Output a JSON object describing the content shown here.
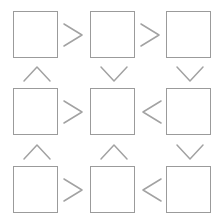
{
  "diagram": {
    "type": "grid-flow-diagram",
    "background_color": "#ffffff",
    "stroke_color": "#9b9b9b",
    "rows": 3,
    "columns": 3,
    "node_label": "empty-square-node",
    "nodes": [
      {
        "id": "node-r1c1",
        "row": 1,
        "col": 1,
        "label": "",
        "shape": "square",
        "x": 13,
        "y": 11,
        "width": 45,
        "height": 47
      },
      {
        "id": "node-r1c2",
        "row": 1,
        "col": 2,
        "label": "",
        "shape": "square",
        "x": 90,
        "y": 11,
        "width": 45,
        "height": 47
      },
      {
        "id": "node-r1c3",
        "row": 1,
        "col": 3,
        "label": "",
        "shape": "square",
        "x": 166,
        "y": 11,
        "width": 45,
        "height": 47
      },
      {
        "id": "node-r2c1",
        "row": 2,
        "col": 1,
        "label": "",
        "shape": "square",
        "x": 13,
        "y": 88,
        "width": 45,
        "height": 47
      },
      {
        "id": "node-r2c2",
        "row": 2,
        "col": 2,
        "label": "",
        "shape": "square",
        "x": 90,
        "y": 88,
        "width": 45,
        "height": 47
      },
      {
        "id": "node-r2c3",
        "row": 2,
        "col": 3,
        "label": "",
        "shape": "square",
        "x": 166,
        "y": 88,
        "width": 45,
        "height": 47
      },
      {
        "id": "node-r3c1",
        "row": 3,
        "col": 1,
        "label": "",
        "shape": "square",
        "x": 13,
        "y": 166,
        "width": 45,
        "height": 47
      },
      {
        "id": "node-r3c2",
        "row": 3,
        "col": 2,
        "label": "",
        "shape": "square",
        "x": 90,
        "y": 166,
        "width": 45,
        "height": 47
      },
      {
        "id": "node-r3c3",
        "row": 3,
        "col": 3,
        "label": "",
        "shape": "square",
        "x": 166,
        "y": 166,
        "width": 45,
        "height": 47
      }
    ],
    "connectors": [
      {
        "id": "conn-r1-c1-c2",
        "glyph": ">",
        "direction": "right",
        "from": "node-r1c1",
        "to": "node-r1c2",
        "x": 62,
        "y": 22,
        "width": 22,
        "height": 26
      },
      {
        "id": "conn-r1-c2-c3",
        "glyph": ">",
        "direction": "right",
        "from": "node-r1c2",
        "to": "node-r1c3",
        "x": 139,
        "y": 22,
        "width": 22,
        "height": 26
      },
      {
        "id": "conn-c1-r1-r2",
        "glyph": "^",
        "direction": "up",
        "from": "node-r2c1",
        "to": "node-r1c1",
        "x": 22,
        "y": 65,
        "width": 30,
        "height": 18
      },
      {
        "id": "conn-c2-r1-r2",
        "glyph": "v",
        "direction": "down",
        "from": "node-r1c2",
        "to": "node-r2c2",
        "x": 99,
        "y": 65,
        "width": 30,
        "height": 18
      },
      {
        "id": "conn-c3-r1-r2",
        "glyph": "v",
        "direction": "down",
        "from": "node-r1c3",
        "to": "node-r2c3",
        "x": 175,
        "y": 65,
        "width": 30,
        "height": 18
      },
      {
        "id": "conn-r2-c1-c2",
        "glyph": ">",
        "direction": "right",
        "from": "node-r2c1",
        "to": "node-r2c2",
        "x": 62,
        "y": 99,
        "width": 22,
        "height": 26
      },
      {
        "id": "conn-r2-c3-c2",
        "glyph": "<",
        "direction": "left",
        "from": "node-r2c3",
        "to": "node-r2c2",
        "x": 141,
        "y": 99,
        "width": 22,
        "height": 26
      },
      {
        "id": "conn-c1-r2-r3",
        "glyph": "^",
        "direction": "up",
        "from": "node-r3c1",
        "to": "node-r2c1",
        "x": 22,
        "y": 143,
        "width": 30,
        "height": 18
      },
      {
        "id": "conn-c2-r2-r3",
        "glyph": "^",
        "direction": "up",
        "from": "node-r3c2",
        "to": "node-r2c2",
        "x": 99,
        "y": 143,
        "width": 30,
        "height": 18
      },
      {
        "id": "conn-c3-r2-r3",
        "glyph": "v",
        "direction": "down",
        "from": "node-r2c3",
        "to": "node-r3c3",
        "x": 175,
        "y": 143,
        "width": 30,
        "height": 18
      },
      {
        "id": "conn-r3-c1-c2",
        "glyph": ">",
        "direction": "right",
        "from": "node-r3c1",
        "to": "node-r3c2",
        "x": 62,
        "y": 177,
        "width": 22,
        "height": 26
      },
      {
        "id": "conn-r3-c3-c2",
        "glyph": "<",
        "direction": "left",
        "from": "node-r3c3",
        "to": "node-r3c2",
        "x": 141,
        "y": 177,
        "width": 22,
        "height": 26
      }
    ]
  }
}
